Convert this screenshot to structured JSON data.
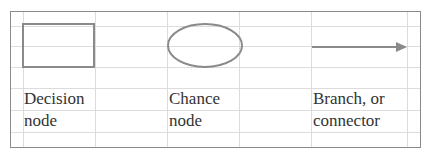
{
  "legend": {
    "items": [
      {
        "shape": "rectangle",
        "label_line1": "Decision",
        "label_line2": "node"
      },
      {
        "shape": "ellipse",
        "label_line1": "Chance",
        "label_line2": "node"
      },
      {
        "shape": "arrow",
        "label_line1": "Branch, or",
        "label_line2": "connector"
      }
    ]
  },
  "colors": {
    "shape_stroke": "#8a8a8a",
    "gridline": "#dcdcdc",
    "text": "#333333"
  }
}
